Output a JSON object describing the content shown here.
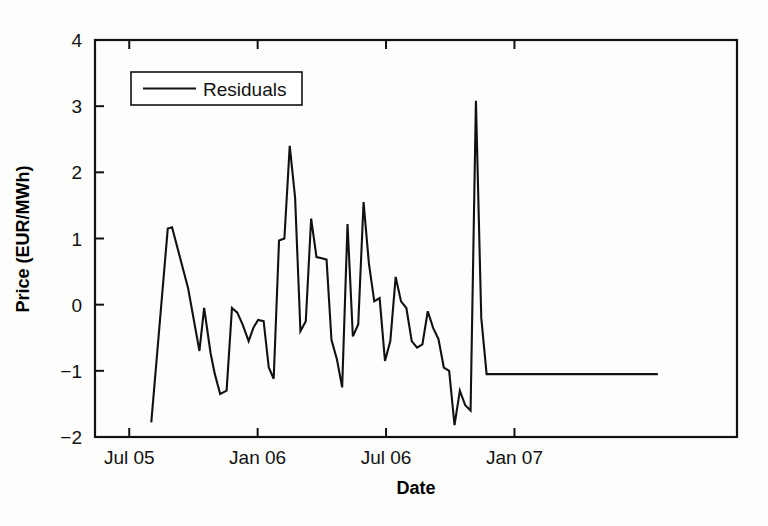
{
  "chart_data": {
    "type": "line",
    "title": "",
    "xlabel": "Date",
    "ylabel": "Price (EUR/MWh)",
    "xlim": [
      0,
      30
    ],
    "ylim": [
      -2,
      4
    ],
    "grid": false,
    "legend_position": "top-left",
    "x_tick_labels": [
      "Jul 05",
      "Jan 06",
      "Jul 06",
      "Jan 07"
    ],
    "x_tick_values": [
      1.6,
      7.6,
      13.6,
      19.6
    ],
    "y_tick_labels": [
      "-2",
      "-1",
      "0",
      "1",
      "2",
      "3",
      "4"
    ],
    "y_tick_values": [
      -2,
      -1,
      0,
      1,
      2,
      3,
      4
    ],
    "series": [
      {
        "name": "Residuals",
        "color": "#111111",
        "x": [
          2.63,
          3.4,
          3.6,
          4.35,
          4.88,
          5.1,
          5.4,
          5.6,
          5.85,
          6.15,
          6.4,
          6.65,
          6.9,
          7.18,
          7.4,
          7.62,
          7.88,
          8.12,
          8.35,
          8.6,
          8.85,
          9.1,
          9.35,
          9.6,
          9.85,
          10.1,
          10.35,
          10.6,
          10.82,
          11.05,
          11.3,
          11.55,
          11.8,
          12.05,
          12.3,
          12.55,
          12.8,
          13.05,
          13.3,
          13.55,
          13.8,
          14.05,
          14.3,
          14.55,
          14.8,
          15.05,
          15.3,
          15.55,
          15.8,
          16.05,
          16.3,
          16.55,
          16.8,
          17.05,
          17.3,
          17.55,
          17.8,
          18.05,
          18.3,
          18.55,
          18.8,
          19.05,
          19.3,
          19.55,
          19.8,
          20.05,
          20.3,
          20.55,
          20.8,
          21.05,
          21.3,
          21.55,
          21.8,
          22.05,
          22.3,
          22.55,
          22.8,
          23.05,
          23.3,
          23.55,
          23.8,
          24.05,
          24.3,
          24.55,
          24.8,
          25.05,
          25.3,
          25.55,
          25.8,
          26.05,
          26.3
        ],
        "y": [
          -1.78,
          1.15,
          1.17,
          0.25,
          -0.7,
          -0.05,
          -0.73,
          -1.05,
          -1.35,
          -1.3,
          -0.05,
          -0.12,
          -0.3,
          -0.55,
          -0.35,
          -0.23,
          -0.25,
          -0.95,
          -1.12,
          0.97,
          1.0,
          2.4,
          1.62,
          -0.4,
          -0.25,
          1.3,
          0.72,
          0.7,
          0.68,
          -0.53,
          -0.82,
          -1.25,
          1.22,
          -0.48,
          -0.3,
          1.55,
          0.62,
          0.05,
          0.1,
          -0.85,
          -0.55,
          0.42,
          0.05,
          -0.05,
          -0.55,
          -0.65,
          -0.6,
          -0.1,
          -0.35,
          -0.52,
          -0.95,
          -1.0,
          -1.82,
          -1.3,
          -1.52,
          -1.6,
          3.08,
          -0.2,
          -1.05,
          -1.05,
          -1.05,
          -1.05,
          -1.05,
          -1.05,
          -1.05,
          -1.05,
          -1.05,
          -1.05,
          -1.05,
          -1.05,
          -1.05,
          -1.05,
          -1.05,
          -1.05,
          -1.05,
          -1.05,
          -1.05,
          -1.05,
          -1.05,
          -1.05,
          -1.05,
          -1.05,
          -1.05,
          -1.05,
          -1.05,
          -1.05,
          -1.05,
          -1.05,
          -1.05,
          -1.05,
          -1.05
        ]
      }
    ]
  },
  "legend": {
    "entries": [
      {
        "label": "Residuals"
      }
    ]
  },
  "axes": {
    "x_title": "Date",
    "y_title": "Price (EUR/MWh)"
  }
}
